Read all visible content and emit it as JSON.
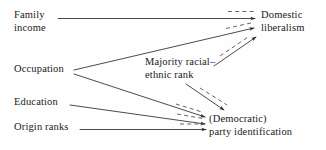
{
  "diagram": {
    "type": "path-diagram",
    "title": "",
    "background_color": "#fefefe",
    "line_color": "#2b2b2b",
    "dashed_line_color": "#555555",
    "nodes": [
      {
        "id": "family_income",
        "label_line1": "Family",
        "label_line2": "income",
        "column": "left",
        "x": 14,
        "y": 9
      },
      {
        "id": "occupation",
        "label_line1": "Occupation",
        "label_line2": "",
        "column": "left",
        "x": 14,
        "y": 63
      },
      {
        "id": "education",
        "label_line1": "Education",
        "label_line2": "",
        "column": "left",
        "x": 14,
        "y": 96
      },
      {
        "id": "origin_ranks",
        "label_line1": "Origin ranks",
        "label_line2": "",
        "column": "left",
        "x": 14,
        "y": 121
      },
      {
        "id": "majority_rank",
        "label_line1": "Majority racial–",
        "label_line2": "ethnic rank",
        "column": "middle",
        "x": 145,
        "y": 56
      },
      {
        "id": "domestic_liberalism",
        "label_line1": "Domestic",
        "label_line2": "liberalism",
        "column": "right",
        "x": 261,
        "y": 9
      },
      {
        "id": "party_identification",
        "label_line1": "(Democratic)",
        "label_line2": "party identification",
        "column": "right",
        "x": 209,
        "y": 113
      }
    ],
    "edges": [
      {
        "id": "e1",
        "from": "family_income",
        "to": "domestic_liberalism",
        "style": "solid-with-dashed"
      },
      {
        "id": "e2",
        "from": "occupation",
        "to": "domestic_liberalism",
        "style": "solid-with-dashed"
      },
      {
        "id": "e3",
        "from": "majority_rank",
        "to": "domestic_liberalism",
        "style": "solid-with-dashed"
      },
      {
        "id": "e4",
        "from": "occupation",
        "to": "party_identification",
        "style": "solid-with-dashed"
      },
      {
        "id": "e5",
        "from": "education",
        "to": "party_identification",
        "style": "solid-with-dashed"
      },
      {
        "id": "e6",
        "from": "origin_ranks",
        "to": "party_identification",
        "style": "solid-with-dashed"
      },
      {
        "id": "e7",
        "from": "majority_rank",
        "to": "party_identification",
        "style": "solid-with-dashed"
      }
    ]
  }
}
